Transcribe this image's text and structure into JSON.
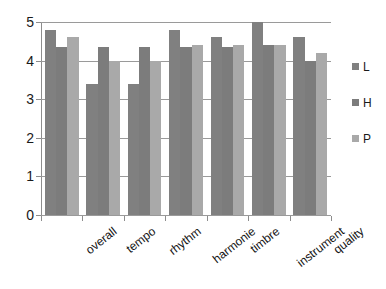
{
  "chart_data": {
    "type": "bar",
    "title": "",
    "subtitle": "",
    "xlabel": "",
    "ylabel": "",
    "ylim": [
      0,
      5
    ],
    "ytick_labels": [
      "5",
      "4",
      "3",
      "2",
      "1",
      "0"
    ],
    "ytick_values": [
      5,
      4,
      3,
      2,
      1,
      0
    ],
    "grid": true,
    "grid_axis": "y",
    "legend_position": "right",
    "categories": [
      "overall",
      "tempo",
      "rhythm",
      "harmonie",
      "timbre",
      "instrument",
      "quality"
    ],
    "series": [
      {
        "name": "L",
        "color": "#808080",
        "values": [
          4.8,
          3.4,
          3.4,
          4.8,
          4.6,
          5.0,
          4.6
        ]
      },
      {
        "name": "H",
        "color": "#7c7c7c",
        "values": [
          4.35,
          4.35,
          4.35,
          4.35,
          4.35,
          4.4,
          4.0
        ]
      },
      {
        "name": "P",
        "color": "#a9a9a9",
        "values": [
          4.6,
          4.0,
          4.0,
          4.4,
          4.4,
          4.4,
          4.2
        ]
      }
    ]
  },
  "legend": {
    "items": [
      {
        "label": "L",
        "color": "#808080"
      },
      {
        "label": "H",
        "color": "#7c7c7c"
      },
      {
        "label": "P",
        "color": "#a9a9a9"
      }
    ]
  },
  "colors": {
    "series_L": "#808080",
    "series_H": "#7c7c7c",
    "series_P": "#a9a9a9",
    "gridline": "#9a9a9a",
    "axis": "#8d8d8d",
    "text": "#1a1a1a",
    "background": "#ffffff"
  }
}
